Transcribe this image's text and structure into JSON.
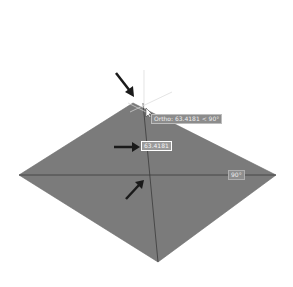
{
  "canvas": {
    "background": "#ffffff",
    "shape": {
      "type": "diamond",
      "fill": "#7b7b7b",
      "vertices": {
        "top": [
          133,
          103
        ],
        "left": [
          19,
          175
        ],
        "right": [
          276,
          175
        ],
        "bottom": [
          158,
          262
        ]
      }
    }
  },
  "tooltips": {
    "ortho": "Ortho: 63.4181 < 90°",
    "length_input": "63.4181",
    "angle": "90°"
  },
  "annotations": {
    "arrow_color": "#1a1a1a",
    "arrows": [
      {
        "name": "arrow-to-vertex",
        "from": [
          116,
          73
        ],
        "to": [
          133,
          95
        ]
      },
      {
        "name": "arrow-to-length-input",
        "from": [
          114,
          147
        ],
        "to": [
          138,
          147
        ]
      },
      {
        "name": "arrow-to-center",
        "from": [
          126,
          199
        ],
        "to": [
          143,
          181
        ]
      }
    ]
  }
}
